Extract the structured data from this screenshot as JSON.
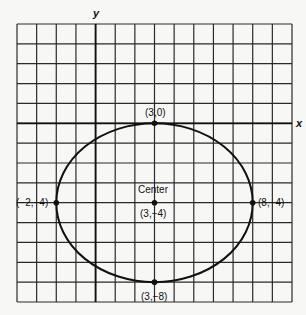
{
  "diagram": {
    "type": "ellipse-on-grid",
    "axes": {
      "x_label": "x",
      "y_label": "y"
    },
    "grid": {
      "x_min": -4,
      "x_max": 10,
      "y_min": -9,
      "y_max": 5,
      "step": 1
    },
    "ellipse": {
      "center": [
        3,
        -4
      ],
      "rx": 5,
      "ry": 4
    },
    "points": [
      {
        "id": "top",
        "x": 3,
        "y": 0,
        "label": "(3,0)"
      },
      {
        "id": "center",
        "x": 3,
        "y": -4,
        "label": "(3,−4)",
        "title": "Center"
      },
      {
        "id": "left",
        "x": -2,
        "y": -4,
        "label": "(−2,−4)"
      },
      {
        "id": "right",
        "x": 8,
        "y": -4,
        "label": "(8,−4)"
      },
      {
        "id": "bottom",
        "x": 3,
        "y": -8,
        "label": "(3,−8)"
      }
    ]
  },
  "colors": {
    "ink": "#1a1a1a",
    "background": "#f7f7f5"
  }
}
